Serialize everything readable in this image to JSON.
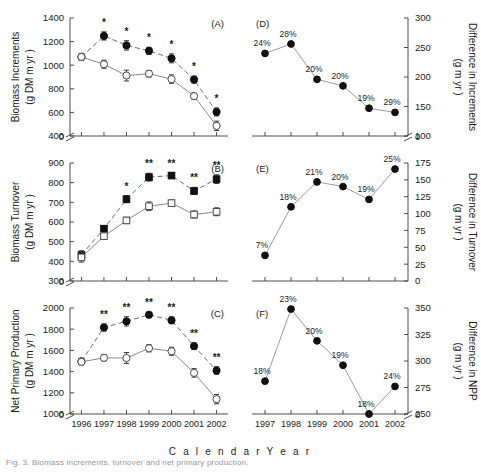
{
  "figure": {
    "caption": "Fig. 3. Biomass increments, turnover and net primary production.",
    "x_axis_title": "C a l e n d a r   Y e a r"
  },
  "chart_data": [
    {
      "type": "line",
      "panel": "(A)",
      "title": "",
      "xlabel": "Calendar Year",
      "ylabel": "Biomass Increments (g DM m-2 yr-1)",
      "ylabel_line1": "Biomass Increments",
      "ylabel_line2": "(g DM m  yr  )",
      "ylim": [
        400,
        1400
      ],
      "yticks": [
        400,
        600,
        800,
        1000,
        1200,
        1400
      ],
      "axis_break": true,
      "break_to": 0,
      "categories": [
        1996,
        1997,
        1998,
        1999,
        2000,
        2001,
        2002
      ],
      "marker_shape": "circle",
      "series": [
        {
          "name": "Elevated",
          "marker": "filled",
          "line": "dashed",
          "values": [
            1070,
            1248,
            1168,
            1122,
            1058,
            878,
            604
          ],
          "errors": [
            28,
            35,
            40,
            30,
            38,
            30,
            34
          ],
          "significance": [
            "",
            "*",
            "*",
            "*",
            "*",
            "*",
            "*"
          ]
        },
        {
          "name": "Ambient",
          "marker": "open",
          "line": "solid",
          "values": [
            1070,
            1008,
            912,
            928,
            882,
            738,
            486
          ],
          "errors": [
            30,
            34,
            46,
            28,
            36,
            26,
            40
          ],
          "significance": [
            "",
            "",
            "",
            "",
            "",
            "",
            ""
          ]
        }
      ]
    },
    {
      "type": "line",
      "panel": "(D)",
      "xlabel": "Calendar Year",
      "ylabel": "Difference in Increments (g m-2 yr-1)",
      "ylabel_line1": "Difference in Increments",
      "ylabel_line2": "(g m  yr  )",
      "ylim": [
        100,
        300
      ],
      "yticks": [
        100,
        150,
        200,
        250,
        300
      ],
      "axis_break": true,
      "break_to": 0,
      "categories": [
        1997,
        1998,
        1999,
        2000,
        2001,
        2002
      ],
      "marker_shape": "circle",
      "values": [
        240,
        256,
        196,
        185,
        147,
        140
      ],
      "labels": [
        "24%",
        "28%",
        "20%",
        "20%",
        "19%",
        "29%"
      ]
    },
    {
      "type": "line",
      "panel": "(B)",
      "xlabel": "Calendar Year",
      "ylabel": "Biomass Turnover (g DM m-2 yr-1)",
      "ylabel_line1": "Biomass Turnover",
      "ylabel_line2": "(g DM m  yr  )",
      "ylim": [
        300,
        900
      ],
      "yticks": [
        300,
        400,
        500,
        600,
        700,
        800,
        900
      ],
      "axis_break": true,
      "break_to": 0,
      "categories": [
        1996,
        1997,
        1998,
        1999,
        2000,
        2001,
        2002
      ],
      "marker_shape": "square",
      "series": [
        {
          "name": "Elevated",
          "marker": "filled",
          "line": "dashed",
          "values": [
            432,
            566,
            716,
            828,
            836,
            758,
            818
          ],
          "errors": [
            22,
            16,
            18,
            20,
            14,
            18,
            22
          ],
          "significance": [
            "",
            "",
            "*",
            "**",
            "**",
            "**",
            "**"
          ]
        },
        {
          "name": "Ambient",
          "marker": "open",
          "line": "solid",
          "values": [
            420,
            528,
            608,
            680,
            696,
            638,
            652
          ],
          "errors": [
            24,
            14,
            16,
            22,
            16,
            18,
            20
          ],
          "significance": [
            "",
            "",
            "",
            "",
            "",
            "",
            ""
          ]
        }
      ]
    },
    {
      "type": "line",
      "panel": "(E)",
      "xlabel": "Calendar Year",
      "ylabel": "Difference in Turnover (g m-2 yr-1)",
      "ylabel_line1": "Difference in Turnover",
      "ylabel_line2": "(g m  yr  )",
      "ylim": [
        0,
        175
      ],
      "yticks": [
        0,
        25,
        50,
        75,
        100,
        125,
        150,
        175
      ],
      "axis_break": false,
      "categories": [
        1997,
        1998,
        1999,
        2000,
        2001,
        2002
      ],
      "marker_shape": "circle",
      "values": [
        38,
        110,
        147,
        140,
        121,
        166
      ],
      "labels": [
        "7%",
        "18%",
        "21%",
        "20%",
        "19%",
        "25%"
      ]
    },
    {
      "type": "line",
      "panel": "(C)",
      "xlabel": "Calendar Year",
      "ylabel": "Net Primary Production (g DM m-2 yr-1)",
      "ylabel_line1": "Net Primary Production",
      "ylabel_line2": "(g DM m  yr  )",
      "ylim": [
        1000,
        2000
      ],
      "yticks": [
        1000,
        1200,
        1400,
        1600,
        1800,
        2000
      ],
      "axis_break": true,
      "break_to": 0,
      "categories": [
        1996,
        1997,
        1998,
        1999,
        2000,
        2001,
        2002
      ],
      "marker_shape": "circle",
      "series": [
        {
          "name": "Elevated",
          "marker": "filled",
          "line": "dashed",
          "values": [
            1496,
            1816,
            1874,
            1936,
            1884,
            1640,
            1410
          ],
          "errors": [
            30,
            34,
            44,
            26,
            32,
            30,
            36
          ],
          "significance": [
            "",
            "**",
            "**",
            "**",
            "**",
            "**",
            "**"
          ]
        },
        {
          "name": "Ambient",
          "marker": "open",
          "line": "solid",
          "values": [
            1492,
            1530,
            1528,
            1620,
            1592,
            1388,
            1140
          ],
          "errors": [
            28,
            30,
            52,
            34,
            38,
            40,
            44
          ],
          "significance": [
            "",
            "",
            "",
            "",
            "",
            "",
            ""
          ]
        }
      ]
    },
    {
      "type": "line",
      "panel": "(F)",
      "xlabel": "Calendar Year",
      "ylabel": "Difference in NPP (g m-2 yr-1)",
      "ylabel_line1": "Difference in NPP",
      "ylabel_line2": "(g m  yr  )",
      "ylim": [
        250,
        350
      ],
      "yticks": [
        250,
        275,
        300,
        325,
        350
      ],
      "axis_break": true,
      "break_to": 0,
      "categories": [
        1997,
        1998,
        1999,
        2000,
        2001,
        2002
      ],
      "marker_shape": "circle",
      "values": [
        281,
        349,
        319,
        296,
        250,
        276
      ],
      "labels": [
        "18%",
        "23%",
        "20%",
        "19%",
        "18%",
        "24%"
      ]
    }
  ]
}
